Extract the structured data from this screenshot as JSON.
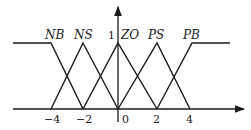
{
  "diagram": {
    "type": "fuzzy-membership-functions",
    "y_axis_label": "1",
    "x_ticks": [
      "−4",
      "−2",
      "0",
      "2",
      "4"
    ],
    "sets": [
      {
        "name": "NB",
        "shape": "left-shoulder",
        "points": [
          [
            -4,
            1
          ],
          [
            -2,
            0
          ]
        ]
      },
      {
        "name": "NS",
        "shape": "triangle",
        "points": [
          [
            -4,
            0
          ],
          [
            -2,
            1
          ],
          [
            0,
            0
          ]
        ]
      },
      {
        "name": "ZO",
        "shape": "triangle",
        "points": [
          [
            -2,
            0
          ],
          [
            0,
            1
          ],
          [
            2,
            0
          ]
        ]
      },
      {
        "name": "PS",
        "shape": "triangle",
        "points": [
          [
            0,
            0
          ],
          [
            2,
            1
          ],
          [
            4,
            0
          ]
        ]
      },
      {
        "name": "PB",
        "shape": "right-shoulder",
        "points": [
          [
            2,
            0
          ],
          [
            4,
            1
          ]
        ]
      }
    ],
    "line_color": "#1a1a1a"
  },
  "labels": {
    "NB": "NB",
    "NS": "NS",
    "ZO": "ZO",
    "PS": "PS",
    "PB": "PB",
    "one": "1"
  },
  "ticks": {
    "m4": "−4",
    "m2": "−2",
    "z": "0",
    "p2": "2",
    "p4": "4"
  }
}
